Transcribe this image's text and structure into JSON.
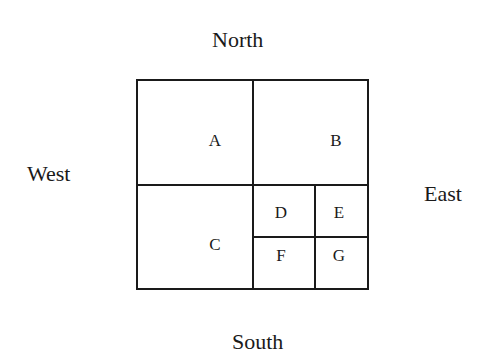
{
  "directions": {
    "north": "North",
    "south": "South",
    "west": "West",
    "east": "East"
  },
  "regions": {
    "a": "A",
    "b": "B",
    "c": "C",
    "d": "D",
    "e": "E",
    "f": "F",
    "g": "G"
  }
}
